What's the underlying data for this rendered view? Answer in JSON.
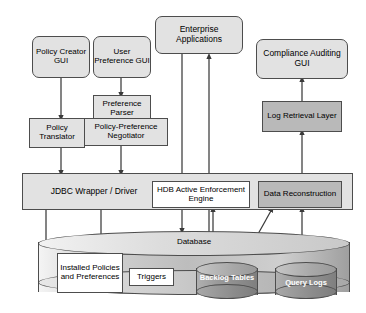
{
  "diagram": {
    "colors": {
      "light_fill": "#e2e2e2",
      "dark_fill": "#b9b9b9",
      "white_fill": "#ffffff",
      "stroke": "#4d4d4d",
      "cylinder_label": "#ffffff"
    },
    "nodes": {
      "policy_creator_gui": "Policy Creator GUI",
      "user_preference_gui": "User Preference GUI",
      "enterprise_applications": "Enterprise Applications",
      "compliance_auditing_gui": "Compliance Auditing GUI",
      "preference_parser": "Preference Parser",
      "policy_preference_negotiator": "Policy-Preference Negotiator",
      "policy_translator": "Policy Translator",
      "log_retrieval_layer": "Log Retrieval Layer",
      "jdbc_wrapper_driver": "JDBC Wrapper / Driver",
      "hdb_active_enforcement_engine": "HDB Active Enforcement Engine",
      "data_reconstruction": "Data Reconstruction",
      "database": "Database",
      "installed_policies_and_preferences": "Installed Policies and Preferences",
      "triggers": "Triggers",
      "backlog_tables": "Backlog Tables",
      "query_logs": "Query Logs"
    },
    "edges": [
      {
        "from": "policy_creator_gui",
        "to": "policy_translator"
      },
      {
        "from": "user_preference_gui",
        "to": "preference_parser"
      },
      {
        "from": "policy_translator",
        "to": "jdbc_wrapper_driver"
      },
      {
        "from": "policy_preference_negotiator",
        "to": "jdbc_wrapper_driver"
      },
      {
        "from": "enterprise_applications",
        "to": "hdb_active_enforcement_engine"
      },
      {
        "from": "query_logs",
        "to": "enterprise_applications"
      },
      {
        "from": "hdb_active_enforcement_engine",
        "to": "database"
      },
      {
        "from": "backlog_tables",
        "to": "hdb_active_enforcement_engine"
      },
      {
        "from": "backlog_tables",
        "to": "data_reconstruction"
      },
      {
        "from": "query_logs",
        "to": "data_reconstruction"
      },
      {
        "from": "data_reconstruction",
        "to": "log_retrieval_layer"
      },
      {
        "from": "log_retrieval_layer",
        "to": "compliance_auditing_gui"
      },
      {
        "from": "jdbc_wrapper_driver",
        "to": "installed_policies_and_preferences"
      },
      {
        "from": "triggers",
        "to": "backlog_tables"
      }
    ]
  }
}
